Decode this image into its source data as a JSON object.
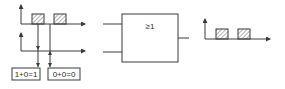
{
  "diagram": {
    "type": "OR gate (logic) timing illustration",
    "gate": {
      "symbol": "≥1",
      "inputs": 2,
      "outputs": 1
    },
    "input_signal_1": {
      "pulses": [
        {
          "start": 32,
          "end": 44
        },
        {
          "start": 54,
          "end": 66
        }
      ],
      "hatched": true
    },
    "input_signal_2": {
      "pulses": [],
      "level": "low"
    },
    "output_signal": {
      "pulses": [
        {
          "start": 216,
          "end": 228
        },
        {
          "start": 238,
          "end": 250
        }
      ],
      "hatched": true
    },
    "equations": [
      {
        "text": "1+0=1"
      },
      {
        "text": "0+0=0"
      }
    ],
    "colors": {
      "line": "#3a3a3a",
      "hatch": "#555555",
      "background": "#ffffff"
    }
  }
}
